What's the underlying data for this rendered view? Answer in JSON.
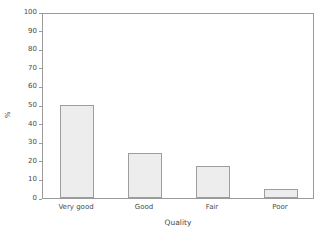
{
  "chart_data": {
    "type": "bar",
    "title": "",
    "categories": [
      "Very good",
      "Good",
      "Fair",
      "Poor"
    ],
    "values": [
      50,
      24,
      17,
      5
    ],
    "xlabel": "Quality",
    "ylabel": "%",
    "ylim": [
      0,
      100
    ],
    "ytick_labels": [
      "0",
      "10",
      "20",
      "30",
      "40",
      "50",
      "60",
      "70",
      "80",
      "90",
      "100"
    ],
    "ytick_values": [
      0,
      10,
      20,
      30,
      40,
      50,
      60,
      70,
      80,
      90,
      100
    ],
    "grid": false,
    "legend": null,
    "bar_fill_color": "#ededed",
    "bar_border_color": "#9d9d9d",
    "axis_color": "#9a9a9a",
    "text_color": "#4a4a4a",
    "background_color": "#ffffff"
  }
}
